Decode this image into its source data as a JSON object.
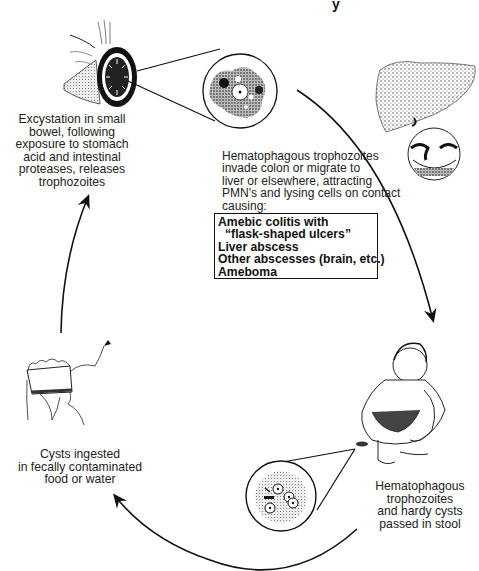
{
  "diagram": {
    "type": "life-cycle",
    "title_fragment": "y",
    "stages": [
      {
        "id": "excystation",
        "illustration": "small-bowel-cross-section",
        "caption_lines": [
          "Excystation in small",
          "bowel, following",
          "exposure to stomach",
          "acid and intestinal",
          "proteases, releases",
          "trophozoites"
        ]
      },
      {
        "id": "invasion",
        "illustration": "liver-and-flask-ulcer",
        "caption_lines": [
          "Hematophagous trophozoites",
          "invade colon or migrate to",
          "liver or elsewhere, attracting",
          "PMN's and lysing cells on contact",
          "causing:"
        ],
        "conditions": [
          "Amebic colitis with",
          "“flask-shaped ulcers”",
          "Liver abscess",
          "Other abscesses (brain, etc.)",
          "Ameboma"
        ]
      },
      {
        "id": "shedding",
        "illustration": "crouching-child-passing-stool",
        "caption_lines": [
          "Hematophagous",
          "trophozoites",
          "and hardy cysts",
          "passed in stool"
        ]
      },
      {
        "id": "ingestion",
        "illustration": "person-drinking-from-cup",
        "caption_lines": [
          "Cysts ingested",
          "in fecally contaminated",
          "food or water"
        ]
      }
    ],
    "magnified_views": [
      {
        "id": "trophozoite",
        "label": "trophozoite-magnified"
      },
      {
        "id": "cyst",
        "label": "cyst-magnified"
      }
    ],
    "arrows": [
      {
        "from": "invasion",
        "to": "shedding",
        "direction": "clockwise"
      },
      {
        "from": "shedding",
        "to": "ingestion",
        "direction": "clockwise"
      },
      {
        "from": "ingestion",
        "to": "excystation",
        "direction": "clockwise"
      }
    ],
    "colors": {
      "ink": "#111111",
      "background": "#ffffff",
      "stipple": "#555555"
    }
  }
}
